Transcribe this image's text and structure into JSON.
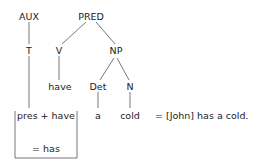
{
  "diagram": {
    "type": "syntax-tree",
    "nodes": {
      "aux": "AUX",
      "pred": "PRED",
      "t": "T",
      "v": "V",
      "np": "NP",
      "have": "have",
      "det": "Det",
      "n": "N",
      "pres_have": "pres + have",
      "a": "a",
      "cold": "cold",
      "has": "= has"
    },
    "gloss": "= [John] has a cold.",
    "edges": [
      [
        "AUX",
        "T"
      ],
      [
        "T",
        "pres + have"
      ],
      [
        "PRED",
        "V"
      ],
      [
        "PRED",
        "NP"
      ],
      [
        "V",
        "have"
      ],
      [
        "NP",
        "Det"
      ],
      [
        "NP",
        "N"
      ],
      [
        "Det",
        "a"
      ],
      [
        "N",
        "cold"
      ]
    ]
  }
}
